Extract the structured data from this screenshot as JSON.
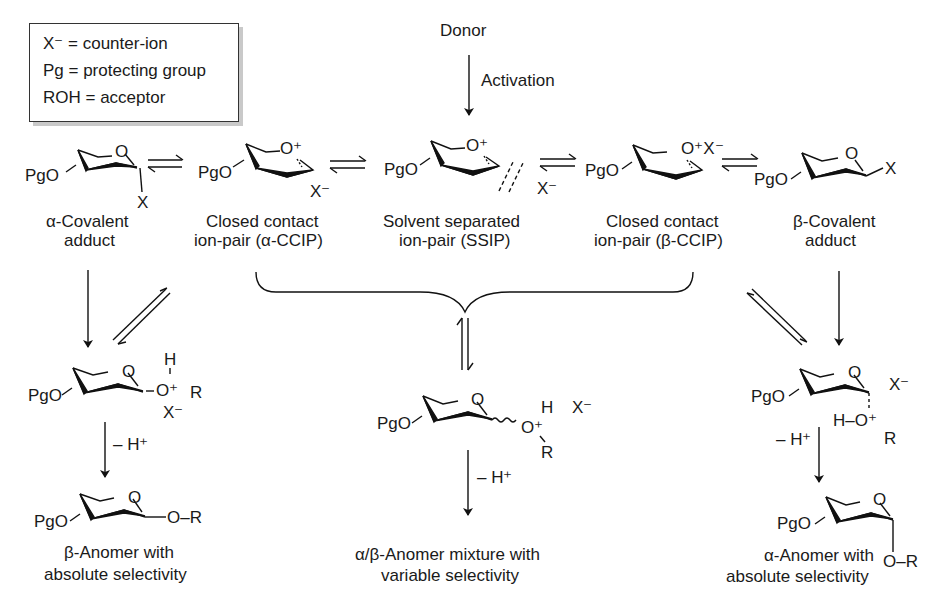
{
  "legend": {
    "items": [
      "X⁻ = counter-ion",
      "Pg = protecting group",
      "ROH = acceptor"
    ]
  },
  "top": {
    "donor": "Donor",
    "activation": "Activation"
  },
  "species": {
    "alpha_covalent": {
      "line1": "α-Covalent",
      "line2": "adduct",
      "pgo": "PgO",
      "x": "X",
      "ring_o": "O"
    },
    "alpha_ccip": {
      "line1": "Closed contact",
      "line2": "ion-pair (α-CCIP)",
      "pgo": "PgO",
      "x": "X⁻",
      "ring_o": "O⁺"
    },
    "ssip": {
      "line1": "Solvent separated",
      "line2": "ion-pair (SSIP)",
      "pgo": "PgO",
      "x": "X⁻",
      "ring_o": "O⁺"
    },
    "beta_ccip": {
      "line1": "Closed contact",
      "line2": "ion-pair (β-CCIP)",
      "pgo": "PgO",
      "x": "O⁺X⁻"
    },
    "beta_covalent": {
      "line1": "β-Covalent",
      "line2": "adduct",
      "pgo": "PgO",
      "x": "X",
      "ring_o": "O"
    }
  },
  "intermediates": {
    "left": {
      "pgo": "PgO",
      "ring_o": "O",
      "h": "H",
      "oplus": "O⁺",
      "r": "R",
      "x": "X⁻"
    },
    "middle": {
      "pgo": "PgO",
      "ring_o": "O",
      "h": "H",
      "x": "X⁻",
      "oplus": "O⁺",
      "r": "R"
    },
    "right": {
      "pgo": "PgO",
      "ring_o": "O",
      "x": "X⁻",
      "h_o": "H–O⁺",
      "r": "R"
    }
  },
  "steps": {
    "minus_h_left": "– H⁺",
    "minus_h_middle": "– H⁺",
    "minus_h_right": "– H⁺"
  },
  "products": {
    "beta": {
      "line1": "β-Anomer with",
      "line2": "absolute selectivity",
      "pgo": "PgO",
      "ring_o": "O",
      "or": "O–R"
    },
    "mixture": {
      "line1": "α/β-Anomer mixture with",
      "line2": "variable selectivity"
    },
    "alpha": {
      "line1": "α-Anomer with",
      "line2": "absolute selectivity",
      "pgo": "PgO",
      "ring_o": "O",
      "or": "O–R"
    }
  }
}
